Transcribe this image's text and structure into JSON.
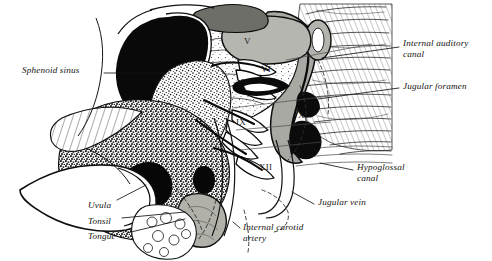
{
  "figure": {
    "kind": "anatomical-illustration",
    "view": "sagittal section of skull base, nasopharynx and oropharynx",
    "style": "black-and-white line drawing with stipple and hatch shading",
    "width": 492,
    "height": 261,
    "background_color": "#ffffff",
    "ink_color": "#101010",
    "gray_fill_color": "#a9a9a4",
    "mid_gray_color": "#8c8c88",
    "light_gray_color": "#cdcdc8"
  },
  "labels": {
    "left": [
      {
        "id": "sphenoid-sinus",
        "text": "Sphenoid sinus",
        "x": 22,
        "y": 69
      },
      {
        "id": "uvula",
        "text": "Uvula",
        "x": 88,
        "y": 205
      },
      {
        "id": "tonsil",
        "text": "Tonsil",
        "x": 88,
        "y": 221
      },
      {
        "id": "tongue",
        "text": "Tongue",
        "x": 88,
        "y": 236
      }
    ],
    "right": [
      {
        "id": "internal-auditory-canal",
        "text": "Internal auditory\ncanal",
        "x": 403,
        "y": 42
      },
      {
        "id": "jugular-foramen",
        "text": "Jugular foramen",
        "x": 403,
        "y": 85
      },
      {
        "id": "hypoglossal-canal",
        "text": "Hypoglossal\ncanal",
        "x": 357,
        "y": 166
      },
      {
        "id": "jugular-vein",
        "text": "Jugular vein",
        "x": 318,
        "y": 201
      },
      {
        "id": "internal-carotid-artery",
        "text": "Internal carotid\nartery",
        "x": 243,
        "y": 226
      }
    ]
  },
  "cranial_nerve_markers": [
    {
      "id": "nerve-v",
      "numeral": "V",
      "x": 244,
      "y": 42,
      "tone": "dark"
    },
    {
      "id": "nerve-vi",
      "numeral": "VI",
      "x": 261,
      "y": 70,
      "tone": "dark"
    },
    {
      "id": "nerve-ix",
      "numeral": "IX",
      "x": 240,
      "y": 123,
      "tone": "dark"
    },
    {
      "id": "nerve-xi",
      "numeral": "XI",
      "x": 298,
      "y": 116,
      "tone": "dark"
    },
    {
      "id": "nerve-xii",
      "numeral": "XII",
      "x": 261,
      "y": 168,
      "tone": "dark"
    }
  ],
  "leader_lines": [
    {
      "id": "leader-sphenoid-sinus",
      "from": [
        104,
        73
      ],
      "to": [
        166,
        73
      ]
    },
    {
      "id": "leader-uvula",
      "from": [
        117,
        200
      ],
      "to": [
        146,
        185
      ]
    },
    {
      "id": "leader-tonsil",
      "from": [
        122,
        218
      ],
      "to": [
        185,
        212
      ]
    },
    {
      "id": "leader-tongue",
      "from": [
        127,
        233
      ],
      "to": [
        185,
        219
      ]
    },
    {
      "id": "leader-internal-auditory-canal",
      "from": [
        399,
        47
      ],
      "to": [
        322,
        58
      ]
    },
    {
      "id": "leader-jugular-foramen",
      "from": [
        399,
        88
      ],
      "to": [
        318,
        99
      ]
    },
    {
      "id": "leader-hypoglossal-canal",
      "from": [
        353,
        170
      ],
      "to": [
        320,
        163
      ]
    },
    {
      "id": "leader-jugular-vein",
      "from": [
        314,
        204
      ],
      "to": [
        292,
        192
      ]
    },
    {
      "id": "leader-internal-carotid-artery",
      "from": [
        240,
        228
      ],
      "to": [
        233,
        222
      ]
    }
  ]
}
